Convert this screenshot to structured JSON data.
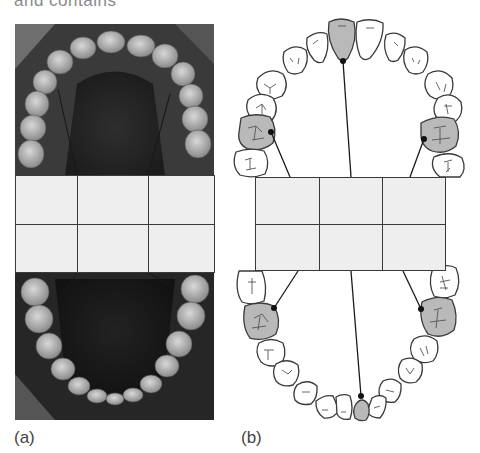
{
  "caption": {
    "partial_text": "and contains"
  },
  "panels": [
    {
      "label": "(a)",
      "type": "intraoral-photograph",
      "description": "Occlusal photograph of upper and lower dental arches",
      "grid": {
        "rows": 2,
        "columns": 3,
        "cells": [
          [
            "",
            "",
            ""
          ],
          [
            "",
            "",
            ""
          ]
        ],
        "fill": "#eeeeee",
        "line_color": "#3a3a3a"
      },
      "pointer_lines": 4
    },
    {
      "label": "(b)",
      "type": "tooth-chart-diagram",
      "description": "Line drawing of upper and lower dental arches with index teeth shaded",
      "grid": {
        "rows": 2,
        "columns": 3,
        "cells": [
          [
            "",
            "",
            ""
          ],
          [
            "",
            "",
            ""
          ]
        ],
        "fill": "#eeeeee",
        "line_color": "#3a3a3a"
      },
      "highlighted_teeth": [
        {
          "arch": "upper",
          "position": "central-incisor",
          "side": "left-of-midline"
        },
        {
          "arch": "upper",
          "position": "first-molar",
          "side": "left"
        },
        {
          "arch": "upper",
          "position": "first-molar",
          "side": "right"
        },
        {
          "arch": "lower",
          "position": "first-molar",
          "side": "left"
        },
        {
          "arch": "lower",
          "position": "first-molar",
          "side": "right"
        },
        {
          "arch": "lower",
          "position": "central-incisor",
          "side": "right-of-midline"
        }
      ],
      "colors": {
        "highlight_fill": "#b9b9b9",
        "tooth_fill": "#ffffff",
        "outline": "#3a3a3a"
      }
    }
  ]
}
